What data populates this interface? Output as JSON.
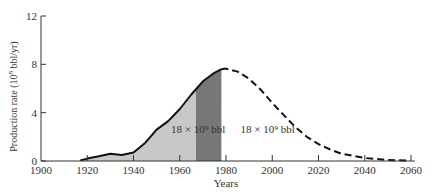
{
  "chart_data": {
    "type": "area",
    "title": "",
    "xlabel": "Years",
    "ylabel": "Production rate (10^8 bbl/yr)",
    "ylabel_parts": {
      "pre": "Production rate (10",
      "sup": "8",
      "post": " bbl/yr)"
    },
    "xlim": [
      1900,
      2060
    ],
    "ylim": [
      0,
      12
    ],
    "x_ticks": [
      1900,
      1920,
      1940,
      1960,
      1980,
      2000,
      2020,
      2040,
      2060
    ],
    "y_ticks": [
      0,
      4,
      8,
      12
    ],
    "grid": false,
    "series": [
      {
        "name": "Historical production",
        "style": "solid",
        "x": [
          1917,
          1920,
          1925,
          1930,
          1935,
          1940,
          1945,
          1950,
          1955,
          1960,
          1965,
          1970,
          1975,
          1978
        ],
        "y": [
          0.05,
          0.2,
          0.4,
          0.6,
          0.5,
          0.7,
          1.5,
          2.6,
          3.3,
          4.3,
          5.5,
          6.6,
          7.3,
          7.6
        ]
      },
      {
        "name": "Projected production",
        "style": "dashed",
        "x": [
          1978,
          1980,
          1985,
          1990,
          1995,
          2000,
          2005,
          2010,
          2015,
          2020,
          2025,
          2030,
          2040,
          2050,
          2058
        ],
        "y": [
          7.6,
          7.65,
          7.4,
          6.8,
          5.9,
          4.8,
          3.8,
          2.8,
          2.0,
          1.4,
          0.95,
          0.6,
          0.25,
          0.08,
          0.03
        ]
      }
    ],
    "shaded_regions": [
      {
        "name": "Light shaded cumulative",
        "from": 1917,
        "to": 1967,
        "color": "#c8c8c8"
      },
      {
        "name": "Dark hatched cumulative",
        "from": 1967,
        "to": 1978,
        "color": "#777777"
      }
    ],
    "annotations": [
      {
        "text": "18 × 10⁹ bbl",
        "x": 1968,
        "y": 2.3,
        "note": "produced to date"
      },
      {
        "text": "18 × 10⁹ bbl",
        "x": 1998,
        "y": 2.3,
        "note": "remaining"
      }
    ]
  }
}
